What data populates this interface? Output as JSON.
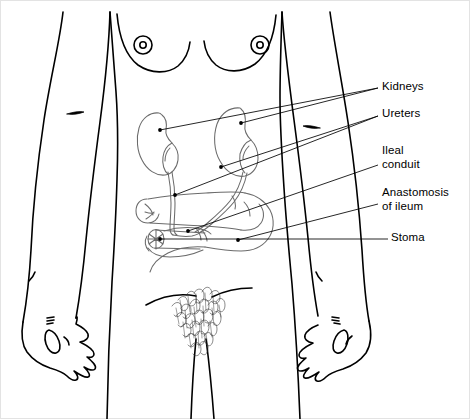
{
  "figure": {
    "stroke_color_outline": "#000000",
    "stroke_color_organs": "#555555",
    "stroke_color_leader": "#000000",
    "background_color": "#ffffff",
    "border_color": "#e3e3e3"
  },
  "labels": [
    {
      "id": "kidneys",
      "text": "Kidneys",
      "lines": [
        "Kidneys"
      ]
    },
    {
      "id": "ureters",
      "text": "Ureters",
      "lines": [
        "Ureters"
      ]
    },
    {
      "id": "ileal",
      "text": "Ileal conduit",
      "lines": [
        "Ileal",
        "conduit"
      ]
    },
    {
      "id": "anastomosis",
      "text": "Anastomosis of ileum",
      "lines": [
        "Anastomosis",
        "of ileum"
      ]
    },
    {
      "id": "stoma",
      "text": "Stoma",
      "lines": [
        "Stoma"
      ]
    }
  ],
  "label_text": {
    "kidneys": "Kidneys",
    "ureters": "Ureters",
    "ileal_line1": "Ileal",
    "ileal_line2": "conduit",
    "anastomosis_line1": "Anastomosis",
    "anastomosis_line2": "of ileum",
    "stoma": "Stoma"
  }
}
